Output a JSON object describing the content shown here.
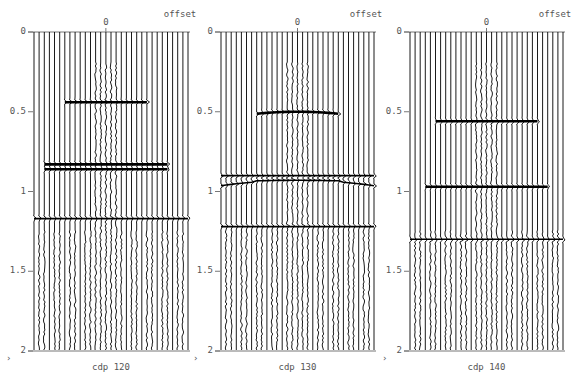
{
  "figure": {
    "panels": [
      {
        "title": "cdp 120",
        "offset_label": "offset",
        "zero_label": "0"
      },
      {
        "title": "cdp 130",
        "offset_label": "offset",
        "zero_label": "0"
      },
      {
        "title": "cdp 140",
        "offset_label": "offset",
        "zero_label": "0"
      }
    ],
    "y_ticks": [
      "0",
      "0.5",
      "1",
      "1.5",
      "2"
    ],
    "side_marks": [
      "›",
      "›",
      "›"
    ]
  },
  "chart_data": [
    {
      "type": "seismic-wiggle",
      "title": "cdp 120",
      "xlabel": "offset",
      "ylabel": "time (s)",
      "ylim": [
        0,
        2
      ],
      "y_ticks": [
        0,
        0.5,
        1,
        1.5,
        2
      ],
      "x_tick": 0,
      "n_traces": 31,
      "events": [
        {
          "time": 0.44,
          "moveout": "flat",
          "span": "near-offset"
        },
        {
          "time": 0.83,
          "moveout": "flat",
          "span": "wide"
        },
        {
          "time": 0.86,
          "moveout": "flat",
          "span": "wide"
        },
        {
          "time": 1.17,
          "moveout": "flat",
          "span": "full"
        }
      ]
    },
    {
      "type": "seismic-wiggle",
      "title": "cdp 130",
      "xlabel": "offset",
      "ylabel": "time (s)",
      "ylim": [
        0,
        2
      ],
      "y_ticks": [
        0,
        0.5,
        1,
        1.5,
        2
      ],
      "x_tick": 0,
      "n_traces": 31,
      "events": [
        {
          "time": 0.5,
          "moveout": "slight-curve",
          "span": "near-offset"
        },
        {
          "time": 0.9,
          "moveout": "flat",
          "span": "full"
        },
        {
          "time": 0.93,
          "moveout": "curved-down",
          "span": "full"
        },
        {
          "time": 1.22,
          "moveout": "flat",
          "span": "full"
        }
      ]
    },
    {
      "type": "seismic-wiggle",
      "title": "cdp 140",
      "xlabel": "offset",
      "ylabel": "time (s)",
      "ylim": [
        0,
        2
      ],
      "y_ticks": [
        0,
        0.5,
        1,
        1.5,
        2
      ],
      "x_tick": 0,
      "n_traces": 31,
      "events": [
        {
          "time": 0.56,
          "moveout": "flat",
          "span": "mid"
        },
        {
          "time": 0.97,
          "moveout": "flat",
          "span": "wide"
        },
        {
          "time": 1.3,
          "moveout": "flat",
          "span": "full"
        }
      ]
    }
  ]
}
